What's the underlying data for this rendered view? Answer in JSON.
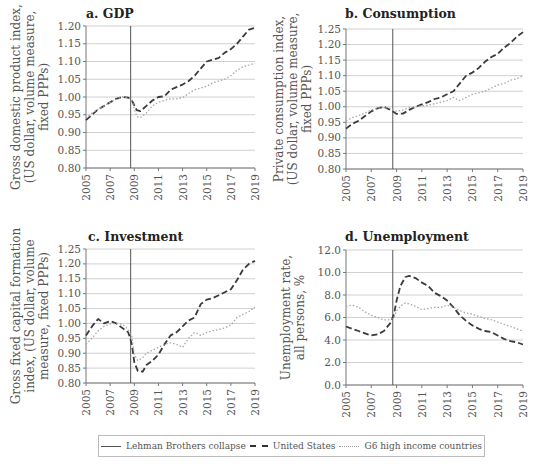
{
  "legend": {
    "items": [
      {
        "label": "Lehman Brothers collapse",
        "style": "solid"
      },
      {
        "label": "United States",
        "style": "dashed"
      },
      {
        "label": "G6  high income countries",
        "style": "dotted"
      }
    ]
  },
  "colors": {
    "us": "#3a3a3a",
    "g6": "#a8a8a8",
    "lehman": "#555555",
    "grid": "#d0d0d0"
  },
  "chart_data": [
    {
      "id": "a",
      "type": "line",
      "title": "a. GDP",
      "ylabel_lines": [
        "Gross domestic product index,",
        "(US dollar, volume measure,",
        "fixed PPPs)"
      ],
      "xticks": [
        "2005",
        "2007",
        "2009",
        "2011",
        "2013",
        "2015",
        "2017",
        "2019"
      ],
      "yticks": [
        "0.80",
        "0.85",
        "0.90",
        "0.95",
        "1.00",
        "1.05",
        "1.10",
        "1.15",
        "1.20"
      ],
      "ylim": [
        0.8,
        1.2
      ],
      "xlim": [
        2005,
        2019
      ],
      "lehman_x": 2008.7,
      "grid": true,
      "series": [
        {
          "name": "United States",
          "x": [
            2005,
            2005.5,
            2006,
            2006.5,
            2007,
            2007.5,
            2008,
            2008.5,
            2008.8,
            2009.2,
            2009.5,
            2010,
            2010.5,
            2011,
            2011.5,
            2012,
            2012.5,
            2013,
            2013.5,
            2014,
            2014.5,
            2015,
            2015.5,
            2016,
            2016.5,
            2017,
            2017.5,
            2018,
            2018.5,
            2019
          ],
          "values": [
            0.935,
            0.95,
            0.965,
            0.975,
            0.985,
            0.995,
            1.0,
            0.998,
            0.99,
            0.963,
            0.96,
            0.975,
            0.99,
            1.0,
            1.002,
            1.02,
            1.028,
            1.035,
            1.045,
            1.06,
            1.08,
            1.1,
            1.105,
            1.11,
            1.125,
            1.135,
            1.15,
            1.17,
            1.19,
            1.195
          ]
        },
        {
          "name": "G6 high income countries",
          "x": [
            2005,
            2005.5,
            2006,
            2006.5,
            2007,
            2007.5,
            2008,
            2008.5,
            2008.8,
            2009.2,
            2009.5,
            2010,
            2010.5,
            2011,
            2011.5,
            2012,
            2012.5,
            2013,
            2013.5,
            2014,
            2014.5,
            2015,
            2015.5,
            2016,
            2016.5,
            2017,
            2017.5,
            2018,
            2018.5,
            2019
          ],
          "values": [
            0.94,
            0.955,
            0.965,
            0.975,
            0.985,
            0.993,
            1.0,
            0.998,
            0.99,
            0.945,
            0.942,
            0.955,
            0.975,
            0.985,
            0.99,
            0.995,
            0.995,
            0.998,
            1.01,
            1.02,
            1.025,
            1.03,
            1.04,
            1.045,
            1.05,
            1.06,
            1.075,
            1.085,
            1.09,
            1.095
          ]
        }
      ]
    },
    {
      "id": "b",
      "type": "line",
      "title": "b. Consumption",
      "ylabel_lines": [
        "Private consumption index,",
        "(US dollar, volume measure,",
        "fixed PPPs)"
      ],
      "xticks": [
        "2005",
        "2007",
        "2009",
        "2011",
        "2013",
        "2015",
        "2017",
        "2019"
      ],
      "yticks": [
        "0.80",
        "0.85",
        "0.90",
        "0.95",
        "1.00",
        "1.05",
        "1.10",
        "1.15",
        "1.20",
        "1.25"
      ],
      "ylim": [
        0.8,
        1.25
      ],
      "xlim": [
        2005,
        2019
      ],
      "lehman_x": 2008.7,
      "grid": true,
      "series": [
        {
          "name": "United States",
          "x": [
            2005,
            2005.5,
            2006,
            2006.5,
            2007,
            2007.5,
            2008,
            2008.5,
            2009,
            2009.5,
            2010,
            2010.5,
            2011,
            2011.5,
            2012,
            2012.5,
            2013,
            2013.5,
            2014,
            2014.5,
            2015,
            2015.5,
            2016,
            2016.5,
            2017,
            2017.5,
            2018,
            2018.5,
            2019
          ],
          "values": [
            0.93,
            0.945,
            0.955,
            0.97,
            0.985,
            0.995,
            1.0,
            0.99,
            0.977,
            0.978,
            0.99,
            1.0,
            1.008,
            1.015,
            1.025,
            1.03,
            1.04,
            1.05,
            1.075,
            1.1,
            1.11,
            1.125,
            1.145,
            1.16,
            1.17,
            1.19,
            1.205,
            1.225,
            1.24
          ]
        },
        {
          "name": "G6 high income countries",
          "x": [
            2005,
            2005.5,
            2006,
            2006.5,
            2007,
            2007.5,
            2008,
            2008.5,
            2009,
            2009.5,
            2010,
            2010.5,
            2011,
            2011.5,
            2012,
            2012.5,
            2013,
            2013.5,
            2014,
            2014.5,
            2015,
            2015.5,
            2016,
            2016.5,
            2017,
            2017.5,
            2018,
            2018.5,
            2019
          ],
          "values": [
            0.955,
            0.965,
            0.972,
            0.98,
            0.99,
            0.995,
            0.998,
            0.995,
            0.985,
            0.99,
            0.997,
            1.0,
            1.003,
            1.005,
            1.01,
            1.015,
            1.02,
            1.03,
            1.02,
            1.03,
            1.04,
            1.045,
            1.05,
            1.06,
            1.07,
            1.075,
            1.085,
            1.09,
            1.1
          ]
        }
      ]
    },
    {
      "id": "c",
      "type": "line",
      "title": "c. Investment",
      "ylabel_lines": [
        "Gross fixed capital formation",
        "index, (US dollar, volume",
        "measure, fixed PPPs)"
      ],
      "xticks": [
        "2005",
        "2007",
        "2009",
        "2011",
        "2013",
        "2015",
        "2017",
        "2019"
      ],
      "yticks": [
        "0.80",
        "0.85",
        "0.90",
        "0.95",
        "1.00",
        "1.05",
        "1.10",
        "1.15",
        "1.20",
        "1.25"
      ],
      "ylim": [
        0.8,
        1.25
      ],
      "xlim": [
        2005,
        2019
      ],
      "lehman_x": 2008.7,
      "grid": true,
      "series": [
        {
          "name": "United States",
          "x": [
            2005,
            2005.5,
            2006,
            2006.5,
            2007,
            2007.5,
            2008,
            2008.5,
            2008.8,
            2009,
            2009.3,
            2009.7,
            2010,
            2010.5,
            2011,
            2011.5,
            2012,
            2012.5,
            2013,
            2013.5,
            2014,
            2014.5,
            2015,
            2015.5,
            2016,
            2016.5,
            2017,
            2017.5,
            2018,
            2018.5,
            2019
          ],
          "values": [
            0.96,
            0.99,
            1.015,
            1.0,
            1.008,
            1.0,
            0.985,
            0.97,
            0.93,
            0.87,
            0.84,
            0.838,
            0.86,
            0.875,
            0.895,
            0.93,
            0.96,
            0.97,
            0.99,
            1.01,
            1.02,
            1.065,
            1.08,
            1.085,
            1.095,
            1.105,
            1.115,
            1.145,
            1.18,
            1.2,
            1.21
          ]
        },
        {
          "name": "G6 high income countries",
          "x": [
            2005,
            2005.5,
            2006,
            2006.5,
            2007,
            2007.5,
            2008,
            2008.5,
            2008.8,
            2009,
            2009.3,
            2009.7,
            2010,
            2010.5,
            2011,
            2011.5,
            2012,
            2012.5,
            2013,
            2013.5,
            2014,
            2014.5,
            2015,
            2015.5,
            2016,
            2016.5,
            2017,
            2017.5,
            2018,
            2018.5,
            2019
          ],
          "values": [
            0.93,
            0.95,
            0.975,
            0.99,
            0.998,
            1.0,
            0.997,
            0.98,
            0.955,
            0.895,
            0.875,
            0.885,
            0.9,
            0.91,
            0.92,
            0.93,
            0.935,
            0.93,
            0.92,
            0.95,
            0.97,
            0.96,
            0.97,
            0.975,
            0.98,
            0.985,
            0.995,
            1.02,
            1.03,
            1.04,
            1.055
          ]
        }
      ]
    },
    {
      "id": "d",
      "type": "line",
      "title": "d. Unemployment",
      "ylabel_lines": [
        "Unemployment rate,",
        "all persons, %"
      ],
      "xticks": [
        "2005",
        "2007",
        "2009",
        "2011",
        "2013",
        "2015",
        "2017",
        "2019"
      ],
      "yticks": [
        "0.0",
        "2.0",
        "4.0",
        "6.0",
        "8.0",
        "10.0",
        "12.0"
      ],
      "ylim": [
        0.0,
        12.0
      ],
      "xlim": [
        2005,
        2019
      ],
      "lehman_x": 2008.7,
      "grid": true,
      "series": [
        {
          "name": "United States",
          "x": [
            2005,
            2005.5,
            2006,
            2006.5,
            2007,
            2007.5,
            2008,
            2008.5,
            2008.8,
            2009,
            2009.3,
            2009.7,
            2010,
            2010.5,
            2011,
            2011.5,
            2012,
            2012.5,
            2013,
            2013.5,
            2014,
            2014.5,
            2015,
            2015.5,
            2016,
            2016.5,
            2017,
            2017.5,
            2018,
            2018.5,
            2019
          ],
          "values": [
            5.2,
            5.0,
            4.8,
            4.6,
            4.4,
            4.5,
            4.8,
            5.5,
            6.3,
            7.5,
            8.8,
            9.6,
            9.7,
            9.5,
            9.1,
            8.8,
            8.2,
            7.9,
            7.5,
            6.9,
            6.2,
            5.7,
            5.3,
            5.0,
            4.8,
            4.7,
            4.4,
            4.1,
            3.9,
            3.8,
            3.6
          ]
        },
        {
          "name": "G6 high income countries",
          "x": [
            2005,
            2005.5,
            2006,
            2006.5,
            2007,
            2007.5,
            2008,
            2008.5,
            2008.8,
            2009,
            2009.3,
            2009.7,
            2010,
            2010.5,
            2011,
            2011.5,
            2012,
            2012.5,
            2013,
            2013.5,
            2014,
            2014.5,
            2015,
            2015.5,
            2016,
            2016.5,
            2017,
            2017.5,
            2018,
            2018.5,
            2019
          ],
          "values": [
            7.0,
            7.1,
            6.9,
            6.5,
            6.2,
            6.0,
            5.8,
            5.8,
            6.0,
            6.6,
            7.0,
            7.3,
            7.2,
            7.0,
            6.7,
            6.8,
            6.9,
            6.9,
            7.1,
            6.9,
            6.6,
            6.4,
            6.3,
            6.1,
            5.9,
            5.8,
            5.6,
            5.4,
            5.2,
            5.0,
            4.8
          ]
        }
      ]
    }
  ]
}
